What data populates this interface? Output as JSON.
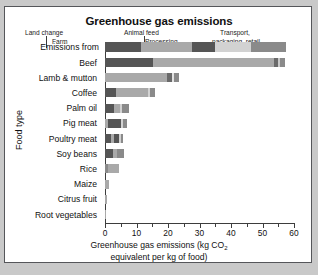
{
  "chart_data": {
    "type": "bar",
    "orientation": "horizontal",
    "stacked": true,
    "title": "Greenhouse gas emissions",
    "xlabel_line1": "Greenhouse gas emissions (kg CO",
    "xlabel_sub": "2",
    "xlabel_line2": "equivalent per kg of food)",
    "ylabel": "Food type",
    "xlim": [
      0,
      60
    ],
    "xticks": [
      0,
      5,
      10,
      15,
      20,
      25,
      30,
      35,
      40,
      45,
      50,
      55,
      60
    ],
    "xtick_labels": [
      "0",
      "10",
      "20",
      "30",
      "40",
      "50",
      "60"
    ],
    "xtick_label_values": [
      0,
      10,
      20,
      30,
      40,
      50,
      60
    ],
    "grid": false,
    "legend_position": "above-plot-key-bar",
    "legend_row_label": "Emissions from",
    "series": [
      {
        "name": "Land change",
        "color": "#555555"
      },
      {
        "name": "Farm",
        "color": "#a9a9a9"
      },
      {
        "name": "Animal feed",
        "color": "#555555"
      },
      {
        "name": "Processing",
        "color": "#d2d2d2"
      },
      {
        "name": "Transport, packaging, retail",
        "color": "#8a8a8a"
      }
    ],
    "key_bar_segments": [
      {
        "label": "Land change",
        "start": 0,
        "end": 11.5,
        "color": "#555555"
      },
      {
        "label": "Farm",
        "start": 11.5,
        "end": 27.5,
        "color": "#a9a9a9"
      },
      {
        "label": "Animal feed",
        "start": 27.5,
        "end": 35.0,
        "color": "#555555"
      },
      {
        "label": "Processing",
        "start": 35.0,
        "end": 46.5,
        "color": "#d2d2d2"
      },
      {
        "label": "Transport, packaging, retail",
        "start": 46.5,
        "end": 57.5,
        "color": "#8a8a8a"
      }
    ],
    "categories": [
      "Beef",
      "Lamb & mutton",
      "Coffee",
      "Palm oil",
      "Pig meat",
      "Poultry meat",
      "Soy beans",
      "Rice",
      "Maize",
      "Citrus fruit",
      "Root vegetables"
    ],
    "rows": [
      {
        "category": "Beef",
        "total": 57.0,
        "segments": [
          {
            "w": 15.3,
            "color": "#555555"
          },
          {
            "w": 38.2,
            "color": "#a9a9a9"
          },
          {
            "w": 1.3,
            "color": "#6a6a6a"
          },
          {
            "w": 0.8,
            "color": "#c9c9c9"
          },
          {
            "w": 1.4,
            "color": "#8a8a8a"
          }
        ]
      },
      {
        "category": "Lamb & mutton",
        "total": 23.5,
        "segments": [
          {
            "w": 19.6,
            "color": "#a9a9a9"
          },
          {
            "w": 1.8,
            "color": "#6a6a6a"
          },
          {
            "w": 0.6,
            "color": "#e2e2e2"
          },
          {
            "w": 1.5,
            "color": "#8a8a8a"
          }
        ]
      },
      {
        "category": "Coffee",
        "total": 16.0,
        "segments": [
          {
            "w": 3.6,
            "color": "#555555"
          },
          {
            "w": 10.2,
            "color": "#a9a9a9"
          },
          {
            "w": 0.5,
            "color": "#d2d2d2"
          },
          {
            "w": 1.7,
            "color": "#8a8a8a"
          }
        ]
      },
      {
        "category": "Palm oil",
        "total": 7.5,
        "segments": [
          {
            "w": 2.7,
            "color": "#555555"
          },
          {
            "w": 2.0,
            "color": "#a9a9a9"
          },
          {
            "w": 0.6,
            "color": "#d2d2d2"
          },
          {
            "w": 2.2,
            "color": "#8a8a8a"
          }
        ]
      },
      {
        "category": "Pig meat",
        "total": 7.0,
        "segments": [
          {
            "w": 1.0,
            "color": "#a9a9a9"
          },
          {
            "w": 4.0,
            "color": "#555555"
          },
          {
            "w": 0.8,
            "color": "#d2d2d2"
          },
          {
            "w": 1.2,
            "color": "#8a8a8a"
          }
        ]
      },
      {
        "category": "Poultry meat",
        "total": 5.8,
        "segments": [
          {
            "w": 1.9,
            "color": "#555555"
          },
          {
            "w": 1.0,
            "color": "#a9a9a9"
          },
          {
            "w": 1.6,
            "color": "#555555"
          },
          {
            "w": 0.5,
            "color": "#d2d2d2"
          },
          {
            "w": 0.8,
            "color": "#8a8a8a"
          }
        ]
      },
      {
        "category": "Soy beans",
        "total": 6.0,
        "segments": [
          {
            "w": 2.6,
            "color": "#555555"
          },
          {
            "w": 1.3,
            "color": "#a9a9a9"
          },
          {
            "w": 1.2,
            "color": "#8a8a8a"
          },
          {
            "w": 0.9,
            "color": "#8a8a8a"
          }
        ]
      },
      {
        "category": "Rice",
        "total": 4.5,
        "segments": [
          {
            "w": 0.8,
            "color": "#8a8a8a"
          },
          {
            "w": 3.7,
            "color": "#a9a9a9"
          }
        ]
      },
      {
        "category": "Maize",
        "total": 1.4,
        "segments": [
          {
            "w": 1.4,
            "color": "#a9a9a9"
          }
        ]
      },
      {
        "category": "Citrus fruit",
        "total": 0.5,
        "segments": [
          {
            "w": 0.5,
            "color": "#a9a9a9"
          }
        ]
      },
      {
        "category": "Root vegetables",
        "total": 0.4,
        "segments": [
          {
            "w": 0.4,
            "color": "#a9a9a9"
          }
        ]
      }
    ],
    "annotations": [
      {
        "text": "Land change",
        "x": 5.5
      },
      {
        "text": "Farm",
        "x": 19.0
      },
      {
        "text": "Animal feed",
        "x": 31.0
      },
      {
        "text": "Processing",
        "x": 40.5
      },
      {
        "text": "Transport,",
        "x": 52.0
      },
      {
        "text": "packaging, retail",
        "x": 52.0
      }
    ]
  }
}
